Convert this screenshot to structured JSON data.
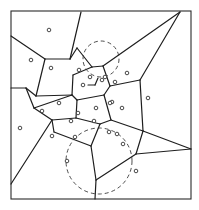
{
  "diagram": {
    "type": "voronoi",
    "canvas": {
      "width": 199,
      "height": 210
    },
    "frame": {
      "x": 11,
      "y": 11,
      "width": 180,
      "height": 188
    },
    "colors": {
      "line": "#1e1e1e",
      "background": "#ffffff"
    },
    "sites": [
      [
        49,
        30
      ],
      [
        31,
        60
      ],
      [
        51,
        68
      ],
      [
        79,
        70
      ],
      [
        83,
        85
      ],
      [
        90,
        77
      ],
      [
        102,
        80
      ],
      [
        115,
        82
      ],
      [
        112,
        102
      ],
      [
        122,
        108
      ],
      [
        59,
        103
      ],
      [
        42,
        111
      ],
      [
        148,
        98
      ],
      [
        78,
        113
      ],
      [
        96,
        108
      ],
      [
        110,
        103
      ],
      [
        71,
        121
      ],
      [
        94,
        121
      ],
      [
        109,
        132
      ],
      [
        75,
        137
      ],
      [
        67,
        161
      ],
      [
        117,
        134
      ],
      [
        123,
        144
      ],
      [
        136,
        171
      ],
      [
        105,
        77
      ],
      [
        127,
        73
      ],
      [
        20,
        128
      ],
      [
        52,
        136
      ]
    ],
    "edges": [
      [
        [
          11,
          36
        ],
        [
          45,
          59
        ]
      ],
      [
        [
          45,
          59
        ],
        [
          70,
          59
        ]
      ],
      [
        [
          70,
          59
        ],
        [
          81,
          12
        ]
      ],
      [
        [
          45,
          59
        ],
        [
          36,
          96
        ]
      ],
      [
        [
          11,
          88
        ],
        [
          26,
          88
        ]
      ],
      [
        [
          26,
          88
        ],
        [
          36,
          96
        ]
      ],
      [
        [
          26,
          88
        ],
        [
          34,
          108
        ]
      ],
      [
        [
          34,
          108
        ],
        [
          72,
          95
        ]
      ],
      [
        [
          36,
          96
        ],
        [
          72,
          95
        ]
      ],
      [
        [
          70,
          59
        ],
        [
          77,
          48
        ]
      ],
      [
        [
          77,
          48
        ],
        [
          92,
          67
        ]
      ],
      [
        [
          92,
          67
        ],
        [
          73,
          75
        ]
      ],
      [
        [
          73,
          75
        ],
        [
          72,
          95
        ]
      ],
      [
        [
          92,
          67
        ],
        [
          103,
          66
        ]
      ],
      [
        [
          103,
          66
        ],
        [
          180,
          12
        ]
      ],
      [
        [
          103,
          66
        ],
        [
          110,
          86
        ]
      ],
      [
        [
          110,
          86
        ],
        [
          140,
          80
        ]
      ],
      [
        [
          140,
          80
        ],
        [
          180,
          12
        ]
      ],
      [
        [
          140,
          80
        ],
        [
          143,
          131
        ]
      ],
      [
        [
          143,
          131
        ],
        [
          191,
          149
        ]
      ],
      [
        [
          110,
          86
        ],
        [
          104,
          95
        ]
      ],
      [
        [
          104,
          95
        ],
        [
          111,
          120
        ]
      ],
      [
        [
          111,
          120
        ],
        [
          143,
          131
        ]
      ],
      [
        [
          72,
          95
        ],
        [
          77,
          100
        ]
      ],
      [
        [
          77,
          100
        ],
        [
          104,
          95
        ]
      ],
      [
        [
          77,
          100
        ],
        [
          76,
          118
        ]
      ],
      [
        [
          76,
          118
        ],
        [
          52,
          120
        ]
      ],
      [
        [
          52,
          120
        ],
        [
          34,
          108
        ]
      ],
      [
        [
          76,
          118
        ],
        [
          100,
          124
        ]
      ],
      [
        [
          100,
          124
        ],
        [
          111,
          120
        ]
      ],
      [
        [
          100,
          124
        ],
        [
          91,
          146
        ]
      ],
      [
        [
          52,
          120
        ],
        [
          11,
          184
        ]
      ],
      [
        [
          91,
          146
        ],
        [
          54,
          132
        ]
      ],
      [
        [
          54,
          132
        ],
        [
          52,
          120
        ]
      ],
      [
        [
          91,
          146
        ],
        [
          96,
          180
        ]
      ],
      [
        [
          96,
          180
        ],
        [
          136,
          154
        ]
      ],
      [
        [
          136,
          154
        ],
        [
          143,
          131
        ]
      ],
      [
        [
          96,
          180
        ],
        [
          95,
          199
        ]
      ],
      [
        [
          136,
          154
        ],
        [
          191,
          149
        ]
      ],
      [
        [
          88,
          85
        ],
        [
          95,
          85
        ]
      ],
      [
        [
          95,
          85
        ],
        [
          98,
          78
        ]
      ]
    ],
    "dashed_circles": [
      {
        "cx": 101,
        "cy": 59,
        "r": 18
      },
      {
        "cx": 99,
        "cy": 161,
        "r": 33
      }
    ],
    "labels": []
  }
}
